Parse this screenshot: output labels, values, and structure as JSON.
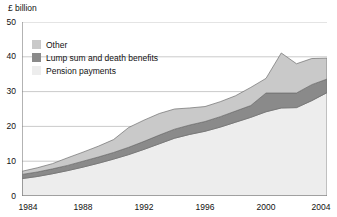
{
  "axis_unit": "£ billion",
  "legend": {
    "items": [
      {
        "label": "Other",
        "color": "#c9c9c9",
        "icon": "legend-swatch-other"
      },
      {
        "label": "Lump sum and death benefits",
        "color": "#8a8a8a",
        "icon": "legend-swatch-lump-sum"
      },
      {
        "label": "Pension payments",
        "color": "#ededed",
        "icon": "legend-swatch-pension"
      }
    ]
  },
  "chart_data": {
    "type": "area",
    "stacked": true,
    "title": "",
    "subtitle": "",
    "xlabel": "",
    "ylabel": "£ billion",
    "xlim": [
      1984,
      2004
    ],
    "ylim": [
      0,
      50
    ],
    "ytick_labels": [
      "0",
      "10",
      "20",
      "30",
      "40",
      "50"
    ],
    "yticks": [
      0,
      10,
      20,
      30,
      40,
      50
    ],
    "xtick_labels": [
      "1984",
      "1988",
      "1992",
      "1996",
      "2000",
      "2004"
    ],
    "xticks": [
      1984,
      1988,
      1992,
      1996,
      2000,
      2004
    ],
    "grid": "horizontal",
    "legend_position": "upper-left-inside",
    "x": [
      1984,
      1985,
      1986,
      1987,
      1988,
      1989,
      1990,
      1991,
      1992,
      1993,
      1994,
      1995,
      1996,
      1997,
      1998,
      1999,
      2000,
      2001,
      2002,
      2003,
      2004
    ],
    "series": [
      {
        "name": "Pension payments",
        "color": "#ededed",
        "values": [
          5.0,
          5.6,
          6.4,
          7.3,
          8.3,
          9.4,
          10.6,
          11.9,
          13.4,
          15.0,
          16.6,
          17.7,
          18.6,
          19.8,
          21.2,
          22.6,
          24.2,
          25.3,
          25.4,
          27.4,
          29.7
        ]
      },
      {
        "name": "Lump sum and death benefits",
        "color": "#8a8a8a",
        "values": [
          1.2,
          1.3,
          1.4,
          1.5,
          1.7,
          1.8,
          1.9,
          2.1,
          2.3,
          2.5,
          2.6,
          2.7,
          2.8,
          3.0,
          3.2,
          3.4,
          5.4,
          4.3,
          4.2,
          4.6,
          3.9
        ]
      },
      {
        "name": "Other",
        "color": "#c9c9c9",
        "values": [
          0.9,
          1.2,
          1.5,
          2.2,
          2.6,
          3.1,
          3.7,
          5.7,
          6.1,
          6.2,
          5.8,
          4.9,
          4.3,
          4.3,
          4.4,
          5.2,
          4.2,
          11.5,
          8.4,
          7.5,
          6.0
        ]
      }
    ],
    "totals": [
      7.1,
      8.1,
      9.3,
      11.0,
      12.6,
      14.3,
      16.2,
      19.7,
      21.8,
      23.7,
      25.0,
      25.3,
      25.7,
      27.1,
      28.8,
      31.2,
      33.8,
      41.1,
      38.0,
      39.5,
      39.6
    ]
  }
}
